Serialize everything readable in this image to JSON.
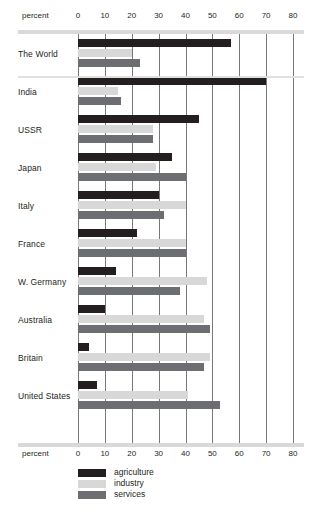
{
  "chart_data": {
    "type": "bar",
    "orientation": "horizontal",
    "title": "",
    "xlabel": "percent",
    "ylabel": "",
    "xlim": [
      0,
      80
    ],
    "xticks": [
      0,
      10,
      20,
      30,
      40,
      50,
      60,
      70,
      80
    ],
    "grid": true,
    "legend_position": "bottom",
    "categories": [
      "The World",
      "India",
      "USSR",
      "Japan",
      "Italy",
      "France",
      "W. Germany",
      "Australia",
      "Britain",
      "United States"
    ],
    "series": [
      {
        "name": "agriculture",
        "color": "#231f20",
        "values": [
          57,
          70,
          45,
          35,
          30,
          22,
          14,
          10,
          4,
          7
        ]
      },
      {
        "name": "industry",
        "color": "#d8d8d8",
        "values": [
          20,
          15,
          28,
          29,
          40,
          40,
          48,
          47,
          49,
          41
        ]
      },
      {
        "name": "services",
        "color": "#6d6e71",
        "values": [
          23,
          16,
          28,
          40,
          32,
          40,
          38,
          49,
          47,
          53
        ]
      }
    ]
  },
  "axis": {
    "percent_label_top": "percent",
    "percent_label_bottom": "percent",
    "tick_labels": [
      "0",
      "10",
      "20",
      "30",
      "40",
      "50",
      "60",
      "70",
      "80"
    ]
  },
  "legend": {
    "items": [
      {
        "label": "agriculture",
        "color": "#231f20"
      },
      {
        "label": "industry",
        "color": "#d8d8d8"
      },
      {
        "label": "services",
        "color": "#6d6e71"
      }
    ]
  }
}
